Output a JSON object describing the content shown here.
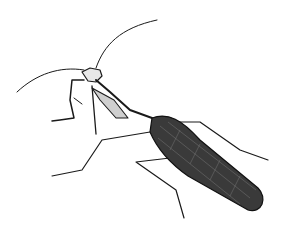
{
  "image": {
    "subject": "praying mantis engraving",
    "background_color": "#ffffff",
    "ink_color": "#1a1a1a"
  }
}
